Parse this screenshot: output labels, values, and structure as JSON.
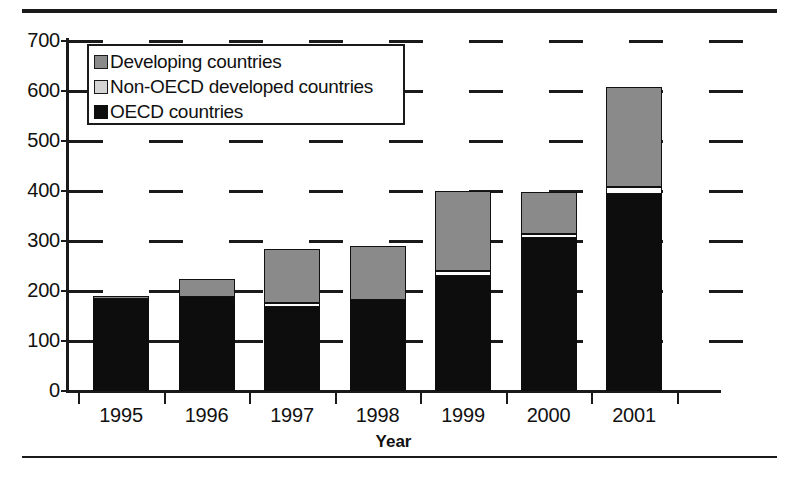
{
  "chart_data": {
    "type": "bar",
    "stacked": true,
    "title": "",
    "xlabel": "Year",
    "ylabel": "",
    "categories": [
      "1995",
      "1996",
      "1997",
      "1998",
      "1999",
      "2000",
      "2001"
    ],
    "ylim": [
      0,
      700
    ],
    "ytick_interval": 100,
    "ytick_labels": [
      "0",
      "100",
      "200",
      "300",
      "400",
      "500",
      "600",
      "700"
    ],
    "ytick_values": [
      0,
      100,
      200,
      300,
      400,
      500,
      600,
      700
    ],
    "grid": "horizontal-dashed",
    "legend_position": "upper-left-inside",
    "series": [
      {
        "name": "OECD countries",
        "color": "#0d0d0d",
        "values": [
          185,
          188,
          168,
          183,
          230,
          306,
          394
        ]
      },
      {
        "name": "Non-OECD developed countries",
        "color": "#fdfdfd",
        "values": [
          0,
          0,
          8,
          0,
          10,
          8,
          14
        ]
      },
      {
        "name": "Developing countries",
        "color": "#8a8a8a",
        "values": [
          5,
          36,
          109,
          107,
          160,
          84,
          200
        ]
      }
    ],
    "totals": [
      190,
      224,
      285,
      290,
      400,
      398,
      608
    ]
  },
  "legend": {
    "items": [
      {
        "label": "Developing countries",
        "swatch": "swatch-developing"
      },
      {
        "label": "Non-OECD developed countries",
        "swatch": "swatch-non-oecd"
      },
      {
        "label": "OECD countries",
        "swatch": "swatch-oecd"
      }
    ]
  }
}
